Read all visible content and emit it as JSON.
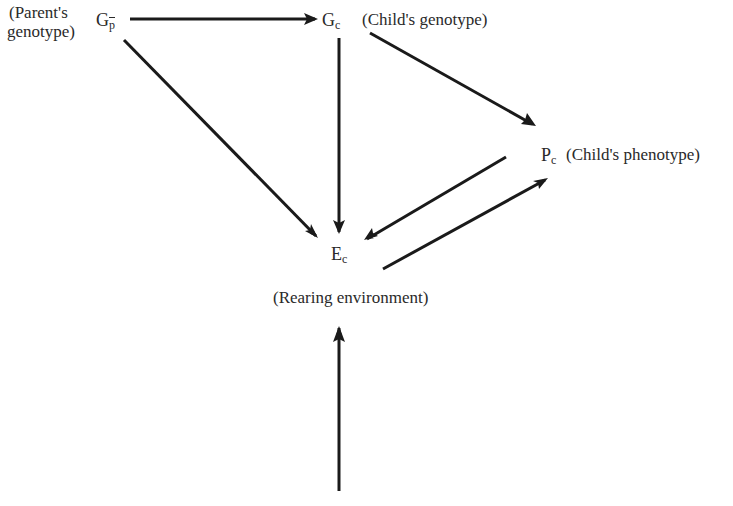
{
  "diagram": {
    "nodes": {
      "parent_genotype": {
        "symbol": "G",
        "subscript": "p",
        "subscript_overbar": true,
        "label_line1": "(Parent's",
        "label_line2": "genotype)"
      },
      "child_genotype": {
        "symbol": "G",
        "subscript": "c",
        "label": "(Child's genotype)"
      },
      "child_phenotype": {
        "symbol": "P",
        "subscript": "c",
        "label": "(Child's phenotype)"
      },
      "rearing_environment": {
        "symbol": "E",
        "subscript": "c",
        "label": "(Rearing environment)"
      }
    },
    "edges": [
      {
        "from": "parent_genotype",
        "to": "child_genotype"
      },
      {
        "from": "parent_genotype",
        "to": "rearing_environment"
      },
      {
        "from": "child_genotype",
        "to": "rearing_environment"
      },
      {
        "from": "child_genotype",
        "to": "child_phenotype"
      },
      {
        "from": "child_phenotype",
        "to": "rearing_environment"
      },
      {
        "from": "rearing_environment",
        "to": "child_phenotype"
      },
      {
        "from": "external",
        "to": "rearing_environment"
      }
    ],
    "colors": {
      "line": "#1a1a1a",
      "text": "#2a2a2a",
      "background": "#ffffff"
    }
  }
}
